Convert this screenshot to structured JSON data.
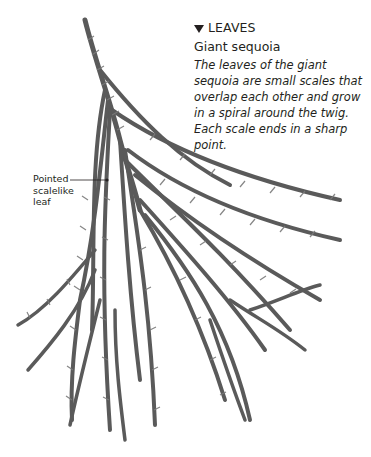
{
  "caption": {
    "heading": "LEAVES",
    "heading_icon": "triangle-down-icon",
    "subtitle": "Giant sequoia",
    "body": "The leaves of the giant sequoia are small scales that overlap each other and grow in a spiral around the twig. Each scale ends in a sharp point."
  },
  "annotation": {
    "label_line1": "Pointed",
    "label_line2": "scalelike",
    "label_line3": "leaf"
  },
  "colors": {
    "text": "#231f20",
    "foliage": "#5a5a5a",
    "foliage_light": "#8a8a8a"
  }
}
